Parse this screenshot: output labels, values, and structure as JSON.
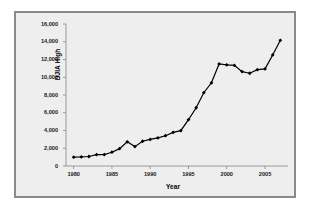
{
  "chart_data": {
    "type": "line",
    "title": "",
    "xlabel": "Year",
    "ylabel": "DJIA High",
    "xlim": [
      1979,
      2008
    ],
    "ylim": [
      0,
      16000
    ],
    "grid": false,
    "legend": "none",
    "x_ticks": [
      "1980",
      "1985",
      "1990",
      "1995",
      "2000",
      "2005"
    ],
    "x_tick_values": [
      1980,
      1985,
      1990,
      1995,
      2000,
      2005
    ],
    "y_ticks": [
      "0",
      "2,000",
      "4,000",
      "6,000",
      "8,000",
      "10,000",
      "12,000",
      "14,000",
      "16,000"
    ],
    "y_tick_values": [
      0,
      2000,
      4000,
      6000,
      8000,
      10000,
      12000,
      14000,
      16000
    ],
    "x": [
      1980,
      1981,
      1982,
      1983,
      1984,
      1985,
      1986,
      1987,
      1988,
      1989,
      1990,
      1991,
      1992,
      1993,
      1994,
      1995,
      1996,
      1997,
      1998,
      1999,
      2000,
      2001,
      2002,
      2003,
      2004,
      2005,
      2006,
      2007
    ],
    "series": [
      {
        "name": "DJIA High",
        "color": "#000000",
        "marker": "diamond",
        "values": [
          1000,
          1024,
          1070,
          1280,
          1290,
          1553,
          1956,
          2722,
          2184,
          2791,
          2999,
          3169,
          3413,
          3794,
          3978,
          5216,
          6561,
          8259,
          9374,
          11497,
          11401,
          11338,
          10635,
          10453,
          10854,
          10940,
          12510,
          14165
        ]
      }
    ]
  }
}
